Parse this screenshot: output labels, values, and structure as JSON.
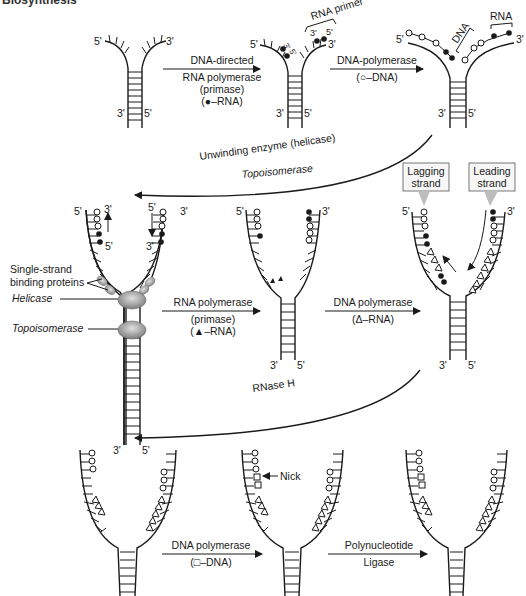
{
  "header": {
    "cut_title": "Biosynthesis"
  },
  "primes": {
    "five": "5'",
    "three": "3'"
  },
  "row1": {
    "step1": {
      "line1": "DNA-directed",
      "line2": "RNA polymerase",
      "line3": "(primase)",
      "line4": "(●–RNA)"
    },
    "step2": {
      "line1": "DNA-polymerase",
      "line2": "(○–DNA)"
    },
    "fork2_label": "RNA primer",
    "fork3_labels": {
      "dna": "DNA",
      "rna": "RNA"
    }
  },
  "transition1": {
    "line1": "Unwinding enzyme (helicase)",
    "line2": "Topoisomerase"
  },
  "row2": {
    "labels": {
      "ssb_line1": "Single-strand",
      "ssb_line2": "binding proteins",
      "helicase": "Helicase",
      "topoisomerase": "Topoisomerase"
    },
    "step3": {
      "line1": "RNA polymerase",
      "line2": "(primase)",
      "line3": "(▲–RNA)"
    },
    "step4": {
      "line1": "DNA polymerase",
      "line2": "(Δ–RNA)"
    },
    "callouts": {
      "lagging_1": "Lagging",
      "lagging_2": "strand",
      "leading_1": "Leading",
      "leading_2": "strand"
    }
  },
  "transition2": {
    "label": "RNase H"
  },
  "row3": {
    "step5": {
      "line1": "DNA polymerase",
      "line2": "(□–DNA)"
    },
    "step6": {
      "line1": "Polynucleotide",
      "line2": "Ligase"
    },
    "nick_label": "Nick"
  },
  "colors": {
    "ink": "#1a1a1a",
    "protein": "#9a9a9a",
    "callout_border": "#555555"
  }
}
